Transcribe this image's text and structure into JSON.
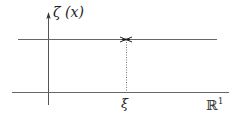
{
  "diagram": {
    "y_axis_label": "ζ (x)",
    "x_axis_label": "ℝ",
    "x_axis_superscript": "1",
    "marker_label": "ξ",
    "colors": {
      "line": "#555555",
      "cross": "#222222",
      "text": "#222222"
    }
  }
}
